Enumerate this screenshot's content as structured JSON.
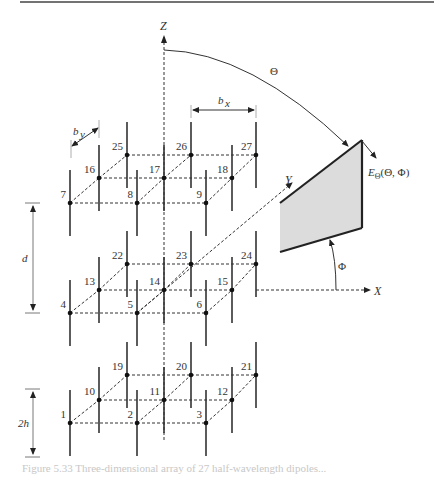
{
  "figure": {
    "axes": {
      "z": "Z",
      "y": "Y",
      "x": "X"
    },
    "angles": {
      "theta": "Θ",
      "phi": "Φ"
    },
    "field_label_main": "E",
    "field_label_sub": "Θ",
    "field_label_args": "(Θ, Φ)",
    "dimensions": {
      "bx": "b",
      "bx_sub": "x",
      "by": "b",
      "by_sub": "y",
      "d": "d",
      "two_h": "2h"
    },
    "nodes": [
      {
        "id": "1",
        "x": 70,
        "y": 423
      },
      {
        "id": "2",
        "x": 137,
        "y": 423
      },
      {
        "id": "3",
        "x": 206,
        "y": 423
      },
      {
        "id": "10",
        "x": 99,
        "y": 400
      },
      {
        "id": "11",
        "x": 164,
        "y": 400
      },
      {
        "id": "12",
        "x": 232,
        "y": 400
      },
      {
        "id": "19",
        "x": 127,
        "y": 375
      },
      {
        "id": "20",
        "x": 191,
        "y": 375
      },
      {
        "id": "21",
        "x": 256,
        "y": 375
      },
      {
        "id": "4",
        "x": 70,
        "y": 313
      },
      {
        "id": "5",
        "x": 137,
        "y": 313
      },
      {
        "id": "6",
        "x": 206,
        "y": 313
      },
      {
        "id": "13",
        "x": 99,
        "y": 290
      },
      {
        "id": "14",
        "x": 164,
        "y": 290
      },
      {
        "id": "15",
        "x": 232,
        "y": 290
      },
      {
        "id": "22",
        "x": 127,
        "y": 264
      },
      {
        "id": "23",
        "x": 191,
        "y": 264
      },
      {
        "id": "24",
        "x": 256,
        "y": 264
      },
      {
        "id": "7",
        "x": 70,
        "y": 203
      },
      {
        "id": "8",
        "x": 137,
        "y": 203
      },
      {
        "id": "9",
        "x": 206,
        "y": 203
      },
      {
        "id": "16",
        "x": 99,
        "y": 178
      },
      {
        "id": "17",
        "x": 164,
        "y": 178
      },
      {
        "id": "18",
        "x": 232,
        "y": 178
      },
      {
        "id": "25",
        "x": 127,
        "y": 155
      },
      {
        "id": "26",
        "x": 191,
        "y": 155
      },
      {
        "id": "27",
        "x": 256,
        "y": 155
      }
    ],
    "caption_partial": "Figure 5.33  Three-dimensional array of 27 half-wavelength dipoles..."
  }
}
